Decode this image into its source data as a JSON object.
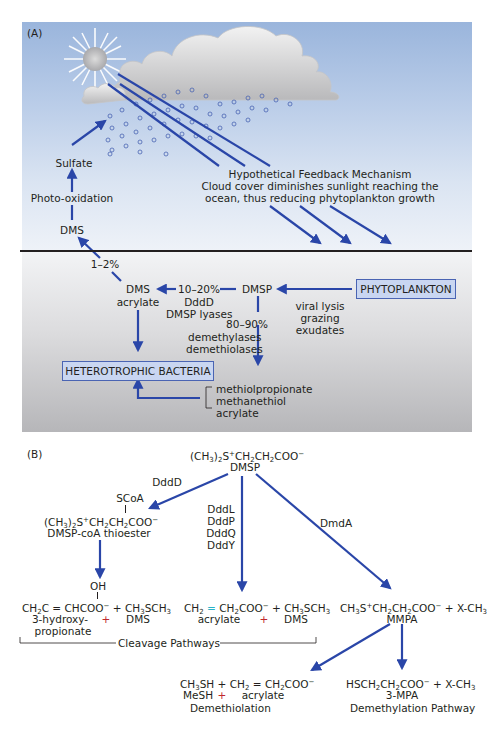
{
  "panel_a": {
    "label": "(A)",
    "sky": {
      "sulfate": "Sulfate",
      "photo_oxidation": "Photo-oxidation",
      "dms": "DMS",
      "feedback_title": "Hypothetical Feedback Mechanism",
      "feedback_line2": "Cloud cover diminishes sunlight reaching the",
      "feedback_line3": "ocean, thus reducing phytoplankton growth"
    },
    "ocean": {
      "pct_1_2": "1–2%",
      "dms_acrylate_line1": "DMS",
      "dms_acrylate_line2": "acrylate",
      "pct_10_20": "10–20%",
      "dddd": "DddD",
      "dmsp_lyases": "DMSP lyases",
      "dmsp": "DMSP",
      "phytoplankton": "PHYTOPLANKTON",
      "viral_lysis": "viral lysis",
      "grazing": "grazing",
      "exudates": "exudates",
      "pct_80_90": "80–90%",
      "demethylases": "demethylases",
      "demethiolases": "demethiolases",
      "heterotrophic_bacteria": "HETEROTROPHIC BACTERIA",
      "products": [
        "methiolpropionate",
        "methanethiol",
        "acrylate"
      ]
    },
    "colors": {
      "arrow": "#2a46a8",
      "box_fill": "#c9d6f1",
      "box_border": "#4a64b3"
    }
  },
  "panel_b": {
    "label": "(B)",
    "dmsp_formula": "(CH3)2S+CH2CH2COO−",
    "dmsp_name": "DMSP",
    "enzyme_dddd": "DddD",
    "enzymes_lyases": [
      "DddL",
      "DddP",
      "DddQ",
      "DddY"
    ],
    "enzyme_dmda": "DmdA",
    "scoa": "SCoA",
    "thioester_formula": "(CH3)2S+CH2CH2COO−",
    "thioester_name": "DMSP-coA thioester",
    "oh": "OH",
    "hydroxy_formula": "CH2C = CHCOO− + CH3SCH3",
    "hydroxy_name_1": "3-hydroxy-",
    "hydroxy_plus": "+",
    "hydroxy_dms": "DMS",
    "hydroxy_name_2": "propionate",
    "acrylate_formula": "CH2 = CH2COO− + CH3SCH3",
    "acrylate_name": "acrylate",
    "acrylate_plus": "+",
    "acrylate_dms": "DMS",
    "cleavage_label": "Cleavage Pathways",
    "mmpa_formula": "CH3S+CH2CH2COO− + X-CH3",
    "mmpa_name": "MMPA",
    "mesh_formula": "CH3SH + CH2 = CH2COO−",
    "mesh_name": "MeSH",
    "mesh_plus": "+",
    "mesh_acrylate": "acrylate",
    "demethiolation": "Demethiolation",
    "mpa_formula": "HSCH2CH2COO− + X-CH3",
    "mpa_name": "3-MPA",
    "demethylation": "Demethylation Pathway"
  }
}
